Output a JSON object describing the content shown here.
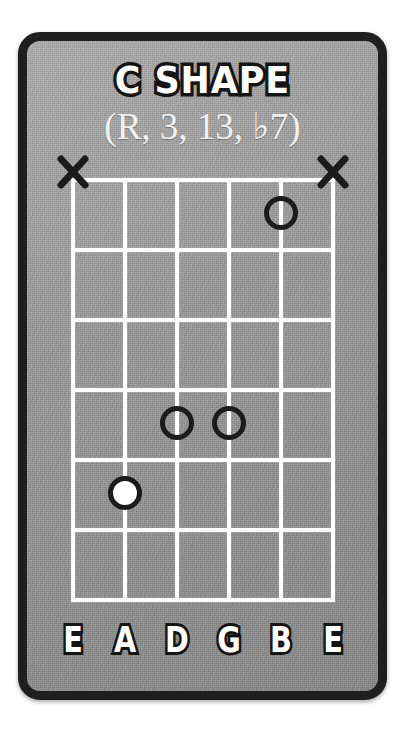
{
  "card": {
    "title": "C SHAPE",
    "subtitle": "(R, 3, 13, ♭7)",
    "background_color": "#9b9b9b",
    "border_color": "#201f1f",
    "line_color": "#ffffff",
    "marker_outline_color": "#1b1b1b",
    "root_fill_color": "#ffffff"
  },
  "chart_data": {
    "type": "table",
    "title": "C SHAPE",
    "subtitle": "(R, 3, 13, ♭7)",
    "instrument": "guitar",
    "string_count": 6,
    "fret_count": 6,
    "strings": [
      {
        "index": 1,
        "label": "E",
        "name": "low-E"
      },
      {
        "index": 2,
        "label": "A",
        "name": "A"
      },
      {
        "index": 3,
        "label": "D",
        "name": "D"
      },
      {
        "index": 4,
        "label": "G",
        "name": "G"
      },
      {
        "index": 5,
        "label": "B",
        "name": "B"
      },
      {
        "index": 6,
        "label": "E",
        "name": "high-E"
      }
    ],
    "frets": [
      1,
      2,
      3,
      4,
      5,
      6
    ],
    "markers": [
      {
        "string": 5,
        "string_label": "B",
        "fret": 1,
        "type": "open-circle",
        "role": "3"
      },
      {
        "string": 3,
        "string_label": "D",
        "fret": 4,
        "type": "open-circle",
        "role": "♭7"
      },
      {
        "string": 4,
        "string_label": "G",
        "fret": 4,
        "type": "open-circle",
        "role": "13"
      },
      {
        "string": 2,
        "string_label": "A",
        "fret": 5,
        "type": "filled-circle",
        "role": "R"
      }
    ],
    "muted_strings": [
      {
        "string": 1,
        "string_label": "E",
        "symbol": "X"
      },
      {
        "string": 6,
        "string_label": "E",
        "symbol": "X"
      }
    ]
  }
}
